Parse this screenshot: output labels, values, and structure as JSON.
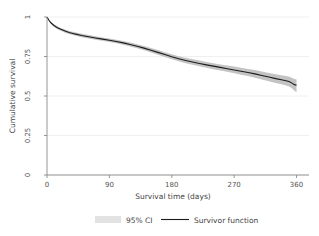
{
  "chart_data": {
    "type": "line",
    "title": "",
    "xlabel": "Survival time (days)",
    "ylabel": "Cumulative survival",
    "xlim": [
      0,
      365
    ],
    "ylim": [
      0,
      1
    ],
    "xticks": [
      0,
      90,
      180,
      270,
      360
    ],
    "xticklabels": [
      "0",
      "90",
      "180",
      "270",
      "360"
    ],
    "yticks": [
      0,
      0.25,
      0.5,
      0.75,
      1
    ],
    "yticklabels": [
      "0",
      "0.25",
      "0.5",
      "0.75",
      "1"
    ],
    "grid": "horizontal",
    "legend_position": "bottom",
    "legend": [
      {
        "label": "95% CI",
        "marker": "band",
        "color": "#e2e2e2"
      },
      {
        "label": "Survivor function",
        "marker": "line",
        "color": "#1b1b1b"
      }
    ],
    "x": [
      0,
      3,
      6,
      10,
      15,
      20,
      26,
      32,
      40,
      50,
      60,
      70,
      80,
      90,
      100,
      110,
      120,
      130,
      140,
      150,
      160,
      170,
      180,
      190,
      200,
      210,
      220,
      230,
      240,
      250,
      260,
      270,
      280,
      290,
      300,
      310,
      320,
      330,
      338,
      345,
      350,
      354,
      357,
      360
    ],
    "series": [
      {
        "name": "Survivor function",
        "values": [
          1.0,
          0.978,
          0.962,
          0.946,
          0.932,
          0.922,
          0.911,
          0.902,
          0.893,
          0.883,
          0.875,
          0.867,
          0.86,
          0.853,
          0.845,
          0.836,
          0.826,
          0.815,
          0.803,
          0.79,
          0.776,
          0.762,
          0.748,
          0.736,
          0.725,
          0.715,
          0.706,
          0.697,
          0.689,
          0.681,
          0.673,
          0.665,
          0.657,
          0.649,
          0.64,
          0.63,
          0.62,
          0.61,
          0.603,
          0.596,
          0.59,
          0.58,
          0.572,
          0.568
        ]
      },
      {
        "name": "95% CI upper",
        "values": [
          1.0,
          0.984,
          0.969,
          0.954,
          0.941,
          0.931,
          0.921,
          0.912,
          0.903,
          0.894,
          0.886,
          0.878,
          0.871,
          0.864,
          0.856,
          0.848,
          0.838,
          0.828,
          0.816,
          0.804,
          0.791,
          0.777,
          0.764,
          0.752,
          0.742,
          0.732,
          0.724,
          0.715,
          0.708,
          0.7,
          0.693,
          0.686,
          0.679,
          0.671,
          0.664,
          0.655,
          0.646,
          0.637,
          0.631,
          0.626,
          0.622,
          0.614,
          0.607,
          0.604
        ]
      },
      {
        "name": "95% CI lower",
        "values": [
          1.0,
          0.972,
          0.955,
          0.938,
          0.923,
          0.913,
          0.901,
          0.892,
          0.883,
          0.872,
          0.864,
          0.856,
          0.849,
          0.842,
          0.834,
          0.824,
          0.814,
          0.802,
          0.79,
          0.776,
          0.761,
          0.747,
          0.732,
          0.72,
          0.708,
          0.698,
          0.688,
          0.679,
          0.67,
          0.662,
          0.653,
          0.644,
          0.635,
          0.627,
          0.616,
          0.605,
          0.594,
          0.583,
          0.575,
          0.566,
          0.558,
          0.546,
          0.534,
          0.524
        ]
      }
    ],
    "annotations": []
  },
  "axes": {
    "y_axis_title": "Cumulative survival",
    "x_axis_title": "Survival time (days)"
  },
  "legend": {
    "ci_label": "95% CI",
    "line_label": "Survivor function"
  },
  "colors": {
    "survivor_line": "#1b1b1b",
    "ci_band": "#b9b9b9",
    "ci_swatch": "#e2e2e2",
    "gridline": "#ececec",
    "axis": "#8a8a8a",
    "background": "#ffffff"
  }
}
